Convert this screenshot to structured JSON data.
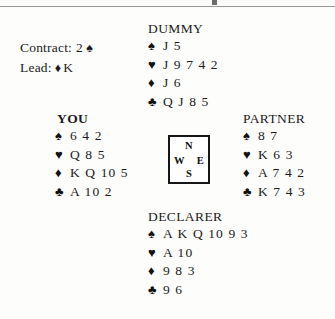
{
  "suits": {
    "spade": "♠",
    "heart": "♥",
    "diamond": "♦",
    "club": "♣"
  },
  "info": {
    "contract_label": "Contract:",
    "contract_value": "2",
    "contract_suit": "♠",
    "lead_label": "Lead:",
    "lead_suit": "♦",
    "lead_value": "K"
  },
  "compass": {
    "north": "N",
    "west": "W",
    "east": "E",
    "south": "S"
  },
  "hands": {
    "dummy": {
      "label": "DUMMY",
      "spades": "J 5",
      "hearts": "J 9 7 4 2",
      "diamonds": "J 6",
      "clubs": "Q J 8 5"
    },
    "you": {
      "label": "YOU",
      "spades": "6 4 2",
      "hearts": "Q 8 5",
      "diamonds": "K Q 10 5",
      "clubs": "A 10 2"
    },
    "partner": {
      "label": "PARTNER",
      "spades": "8 7",
      "hearts": "K 6 3",
      "diamonds": "A 7 4 2",
      "clubs": "K 7 4 3"
    },
    "declarer": {
      "label": "DECLARER",
      "spades": "A K Q 10 9 3",
      "hearts": "A 10",
      "diamonds": "9 8 3",
      "clubs": "9 6"
    }
  },
  "colors": {
    "ink": "#1b1b1b",
    "paper": "#fdfdfc",
    "rule": "#9a9a9a"
  }
}
